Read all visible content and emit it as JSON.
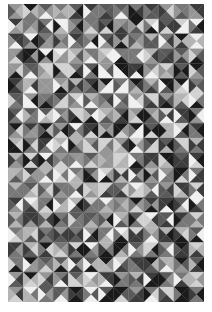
{
  "image": {
    "description": "Geometric mosaic of grayscale triangles arranged in a square grid, each square split by both diagonals into four triangles",
    "background": "#ffffff",
    "grid": {
      "cols": 13,
      "rows": 20,
      "cell_size": 15
    },
    "palette": [
      "#1a1a1a",
      "#3c3c3c",
      "#5a5a5a",
      "#787878",
      "#969696",
      "#b4b4b4",
      "#d2d2d2",
      "#f0f0f0"
    ],
    "seed": 73
  }
}
